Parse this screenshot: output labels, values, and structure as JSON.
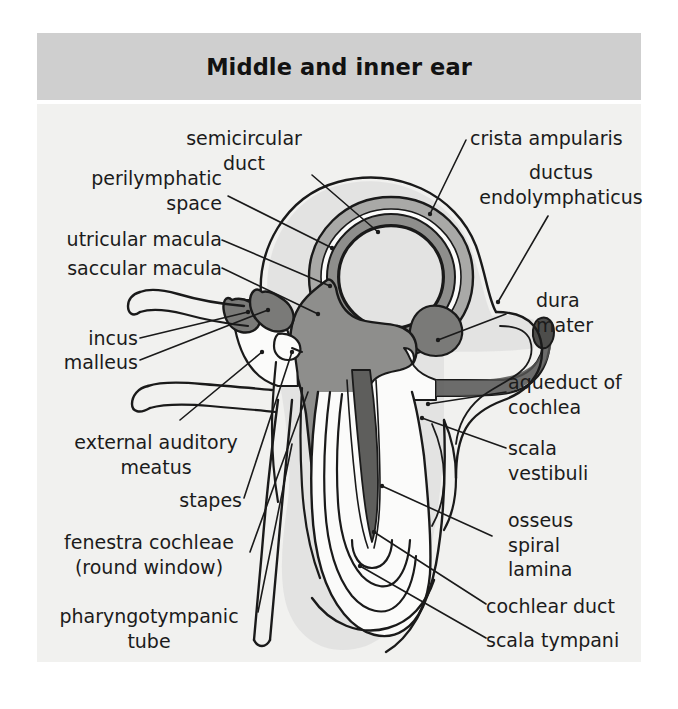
{
  "figure": {
    "title": "Middle and inner ear",
    "background_color": "#ffffff",
    "banner_color": "#cfcfcf",
    "panel_color": "#f1f1ef",
    "text_color": "#1b1b1b",
    "line_color": "#1a1a1a",
    "fill_light_grey": "#d6d6d4",
    "fill_mid_grey": "#a8a8a6",
    "fill_dark_grey": "#6e6e6c",
    "fill_white": "#fbfbfa"
  },
  "labels": {
    "left": [
      {
        "id": "semicircular-duct",
        "text": "semicircular\nduct",
        "align": "center"
      },
      {
        "id": "perilymphatic-space",
        "text": "perilymphatic\nspace",
        "align": "right"
      },
      {
        "id": "utricular-macula",
        "text": "utricular macula",
        "align": "right"
      },
      {
        "id": "saccular-macula",
        "text": "saccular macula",
        "align": "right"
      },
      {
        "id": "incus",
        "text": "incus",
        "align": "right"
      },
      {
        "id": "malleus",
        "text": "malleus",
        "align": "right"
      },
      {
        "id": "external-auditory-meatus",
        "text": "external auditory\nmeatus",
        "align": "center"
      },
      {
        "id": "stapes",
        "text": "stapes",
        "align": "right"
      },
      {
        "id": "fenestra-cochleae",
        "text": "fenestra cochleae\n(round window)",
        "align": "center"
      },
      {
        "id": "pharyngotympanic-tube",
        "text": "pharyngotympanic\ntube",
        "align": "center"
      }
    ],
    "right": [
      {
        "id": "crista-ampularis",
        "text": "crista ampularis",
        "align": "left"
      },
      {
        "id": "ductus-endolymphaticus",
        "text": "ductus\nendolymphaticus",
        "align": "center"
      },
      {
        "id": "dura-mater",
        "text": "dura\nmater",
        "align": "left"
      },
      {
        "id": "aqueduct-of-cochlea",
        "text": "aqueduct of\ncochlea",
        "align": "left"
      },
      {
        "id": "scala-vestibuli",
        "text": "scala\nvestibuli",
        "align": "left"
      },
      {
        "id": "osseus-spiral-lamina",
        "text": "osseus\nspiral\nlamina",
        "align": "left"
      },
      {
        "id": "cochlear-duct",
        "text": "cochlear duct",
        "align": "left"
      },
      {
        "id": "scala-tympani",
        "text": "scala tympani",
        "align": "left"
      }
    ]
  }
}
